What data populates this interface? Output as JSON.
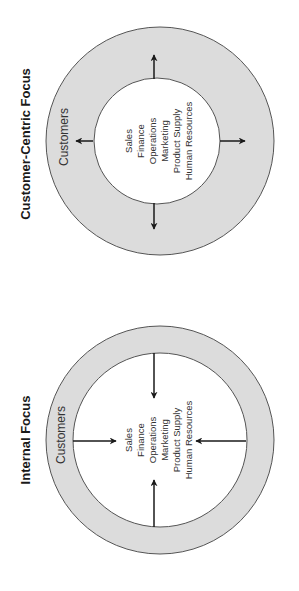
{
  "colors": {
    "background": "#ffffff",
    "ring_fill": "#dcdcdc",
    "inner_fill": "#ffffff",
    "stroke": "#555555",
    "arrow": "#1a1a1a",
    "text": "#333333"
  },
  "orientation": "rotated -90 degrees (text reads bottom-to-top)",
  "diagrams": [
    {
      "id": "customer-centric",
      "title": "Customer-Centric Focus",
      "outer_label": "Customers",
      "departments": [
        "Sales",
        "Finance",
        "Operations",
        "Marketing",
        "Product Supply",
        "Human Resources"
      ],
      "arrow_direction": "outward",
      "arrow_count": 4
    },
    {
      "id": "internal",
      "title": "Internal Focus",
      "outer_label": "Customers",
      "departments": [
        "Sales",
        "Finance",
        "Operations",
        "Marketing",
        "Product Supply",
        "Human Resources"
      ],
      "arrow_direction": "inward",
      "arrow_count": 4
    }
  ]
}
